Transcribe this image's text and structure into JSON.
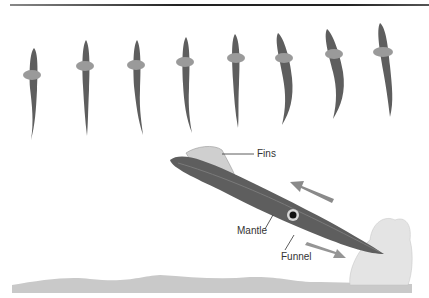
{
  "figure": {
    "labels": {
      "fins": "Fins",
      "mantle": "Mantle",
      "funnel": "Funnel"
    },
    "colors": {
      "body": "#5a5a5a",
      "fin": "#9a9a9a",
      "seabed": "#c8c8c8",
      "arrow": "#8a8a8a"
    },
    "sequence_count": 8
  }
}
